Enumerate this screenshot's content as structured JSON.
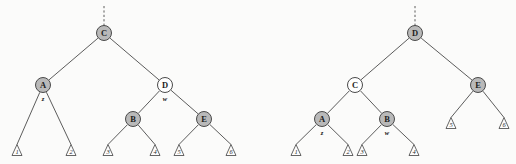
{
  "figure": {
    "colors": {
      "black_node_fill": "#b9b9b9",
      "red_node_fill": "#ffffff",
      "stroke": "#4a4a4a",
      "background": "#fbfbfa"
    }
  },
  "trees": [
    {
      "id": "left-tree",
      "name": "before-rotation",
      "origin_x": 0,
      "parent_edge": {
        "x": 104,
        "y_top": 6,
        "y_bottom": 26
      },
      "nodes": [
        {
          "id": "n-c",
          "label": "C",
          "color": "black",
          "cx": 104,
          "cy": 33,
          "r": 7.5
        },
        {
          "id": "n-a",
          "label": "A",
          "color": "black",
          "cx": 43,
          "cy": 85,
          "r": 7.5
        },
        {
          "id": "n-d",
          "label": "D",
          "color": "red",
          "cx": 165,
          "cy": 85,
          "r": 7.5
        },
        {
          "id": "n-b",
          "label": "B",
          "color": "black",
          "cx": 133,
          "cy": 119,
          "r": 7.5
        },
        {
          "id": "n-e",
          "label": "E",
          "color": "black",
          "cx": 204,
          "cy": 119,
          "r": 7.5
        }
      ],
      "pointers": [
        {
          "id": "ptr-z",
          "label": "z",
          "x": 43,
          "y": 98
        },
        {
          "id": "ptr-w",
          "label": "w",
          "x": 165,
          "y": 98
        }
      ],
      "leaves": [
        {
          "id": "leaf-1",
          "label": "1",
          "cx": 17,
          "cy": 150
        },
        {
          "id": "leaf-2",
          "label": "2",
          "cx": 71,
          "cy": 150
        },
        {
          "id": "leaf-3",
          "label": "3",
          "cx": 108,
          "cy": 150
        },
        {
          "id": "leaf-4",
          "label": "4",
          "cx": 155,
          "cy": 150
        },
        {
          "id": "leaf-5",
          "label": "5",
          "cx": 179,
          "cy": 150
        },
        {
          "id": "leaf-6",
          "label": "6",
          "cx": 231,
          "cy": 150
        }
      ],
      "edges": [
        {
          "from": "n-c",
          "to": "n-a"
        },
        {
          "from": "n-c",
          "to": "n-d"
        },
        {
          "from": "n-a",
          "to": "leaf-1"
        },
        {
          "from": "n-a",
          "to": "leaf-2"
        },
        {
          "from": "n-d",
          "to": "n-b"
        },
        {
          "from": "n-d",
          "to": "n-e"
        },
        {
          "from": "n-b",
          "to": "leaf-3"
        },
        {
          "from": "n-b",
          "to": "leaf-4"
        },
        {
          "from": "n-e",
          "to": "leaf-5"
        },
        {
          "from": "n-e",
          "to": "leaf-6"
        }
      ]
    },
    {
      "id": "right-tree",
      "name": "after-rotation",
      "origin_x": 258,
      "parent_edge": {
        "x": 415,
        "y_top": 6,
        "y_bottom": 26
      },
      "nodes": [
        {
          "id": "m-d",
          "label": "D",
          "color": "black",
          "cx": 415,
          "cy": 33,
          "r": 7.5
        },
        {
          "id": "m-c",
          "label": "C",
          "color": "red",
          "cx": 355,
          "cy": 85,
          "r": 7.5
        },
        {
          "id": "m-e",
          "label": "E",
          "color": "black",
          "cx": 478,
          "cy": 85,
          "r": 7.5
        },
        {
          "id": "m-a",
          "label": "A",
          "color": "black",
          "cx": 322,
          "cy": 119,
          "r": 7.5
        },
        {
          "id": "m-b",
          "label": "B",
          "color": "black",
          "cx": 387,
          "cy": 119,
          "r": 7.5
        }
      ],
      "pointers": [
        {
          "id": "ptr-z2",
          "label": "z",
          "x": 322,
          "y": 132
        },
        {
          "id": "ptr-w2",
          "label": "w",
          "x": 387,
          "y": 132
        }
      ],
      "leaves": [
        {
          "id": "leaf-a1",
          "label": "1",
          "cx": 296,
          "cy": 150
        },
        {
          "id": "leaf-a2",
          "label": "2",
          "cx": 348,
          "cy": 150
        },
        {
          "id": "leaf-a3",
          "label": "3",
          "cx": 362,
          "cy": 150
        },
        {
          "id": "leaf-a4",
          "label": "4",
          "cx": 414,
          "cy": 150
        },
        {
          "id": "leaf-a5",
          "label": "5",
          "cx": 451,
          "cy": 123
        },
        {
          "id": "leaf-a6",
          "label": "6",
          "cx": 504,
          "cy": 123
        }
      ],
      "edges": [
        {
          "from": "m-d",
          "to": "m-c"
        },
        {
          "from": "m-d",
          "to": "m-e"
        },
        {
          "from": "m-c",
          "to": "m-a"
        },
        {
          "from": "m-c",
          "to": "m-b"
        },
        {
          "from": "m-a",
          "to": "leaf-a1"
        },
        {
          "from": "m-a",
          "to": "leaf-a2"
        },
        {
          "from": "m-b",
          "to": "leaf-a3"
        },
        {
          "from": "m-b",
          "to": "leaf-a4"
        },
        {
          "from": "m-e",
          "to": "leaf-a5"
        },
        {
          "from": "m-e",
          "to": "leaf-a6"
        }
      ]
    }
  ]
}
